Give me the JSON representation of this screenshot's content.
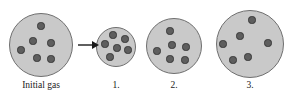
{
  "figure": {
    "background_color": "#ffffff",
    "circle_fill": "#c9c9c9",
    "circle_stroke": "#6f6f6f",
    "particle_fill": "#5e5e5e",
    "particle_stroke": "#3a3a3a",
    "arrow_color": "#1a1a1a"
  },
  "arrow": {
    "name": "transition-arrow",
    "direction": "right",
    "x": 78,
    "y": 45,
    "length": 20
  },
  "panels": [
    {
      "id": "initial-gas",
      "label": "Initial gas",
      "cx": 41,
      "cy": 45,
      "r": 32,
      "label_x": 3,
      "label_y": 80,
      "label_width": 76,
      "particle_count": 6,
      "particles": [
        {
          "x": 41,
          "y": 26,
          "r": 3.6
        },
        {
          "x": 33,
          "y": 41,
          "r": 3.6
        },
        {
          "x": 51,
          "y": 43,
          "r": 3.6
        },
        {
          "x": 21,
          "y": 50,
          "r": 3.6
        },
        {
          "x": 37,
          "y": 58,
          "r": 3.6
        },
        {
          "x": 51,
          "y": 59,
          "r": 3.6
        }
      ]
    },
    {
      "id": "container-1",
      "label": "1.",
      "cx": 116,
      "cy": 47,
      "r": 20,
      "label_x": 96,
      "label_y": 80,
      "label_width": 40,
      "particle_count": 6,
      "particles": [
        {
          "x": 113,
          "y": 35,
          "r": 3.6
        },
        {
          "x": 125,
          "y": 39,
          "r": 3.6
        },
        {
          "x": 105,
          "y": 44,
          "r": 3.6
        },
        {
          "x": 117,
          "y": 48,
          "r": 3.6
        },
        {
          "x": 128,
          "y": 50,
          "r": 3.6
        },
        {
          "x": 110,
          "y": 57,
          "r": 3.6
        }
      ]
    },
    {
      "id": "container-2",
      "label": "2.",
      "cx": 174,
      "cy": 46,
      "r": 28,
      "label_x": 154,
      "label_y": 80,
      "label_width": 40,
      "particle_count": 6,
      "particles": [
        {
          "x": 170,
          "y": 31,
          "r": 3.6
        },
        {
          "x": 172,
          "y": 45,
          "r": 3.6
        },
        {
          "x": 186,
          "y": 47,
          "r": 3.6
        },
        {
          "x": 157,
          "y": 51,
          "r": 3.6
        },
        {
          "x": 170,
          "y": 59,
          "r": 3.6
        },
        {
          "x": 185,
          "y": 60,
          "r": 3.6
        }
      ]
    },
    {
      "id": "container-3",
      "label": "3.",
      "cx": 250,
      "cy": 44,
      "r": 34,
      "label_x": 230,
      "label_y": 80,
      "label_width": 40,
      "particle_count": 6,
      "particles": [
        {
          "x": 252,
          "y": 20,
          "r": 3.6
        },
        {
          "x": 240,
          "y": 36,
          "r": 3.6
        },
        {
          "x": 223,
          "y": 44,
          "r": 3.6
        },
        {
          "x": 268,
          "y": 43,
          "r": 3.6
        },
        {
          "x": 248,
          "y": 57,
          "r": 3.6
        },
        {
          "x": 233,
          "y": 60,
          "r": 3.6
        }
      ]
    }
  ]
}
